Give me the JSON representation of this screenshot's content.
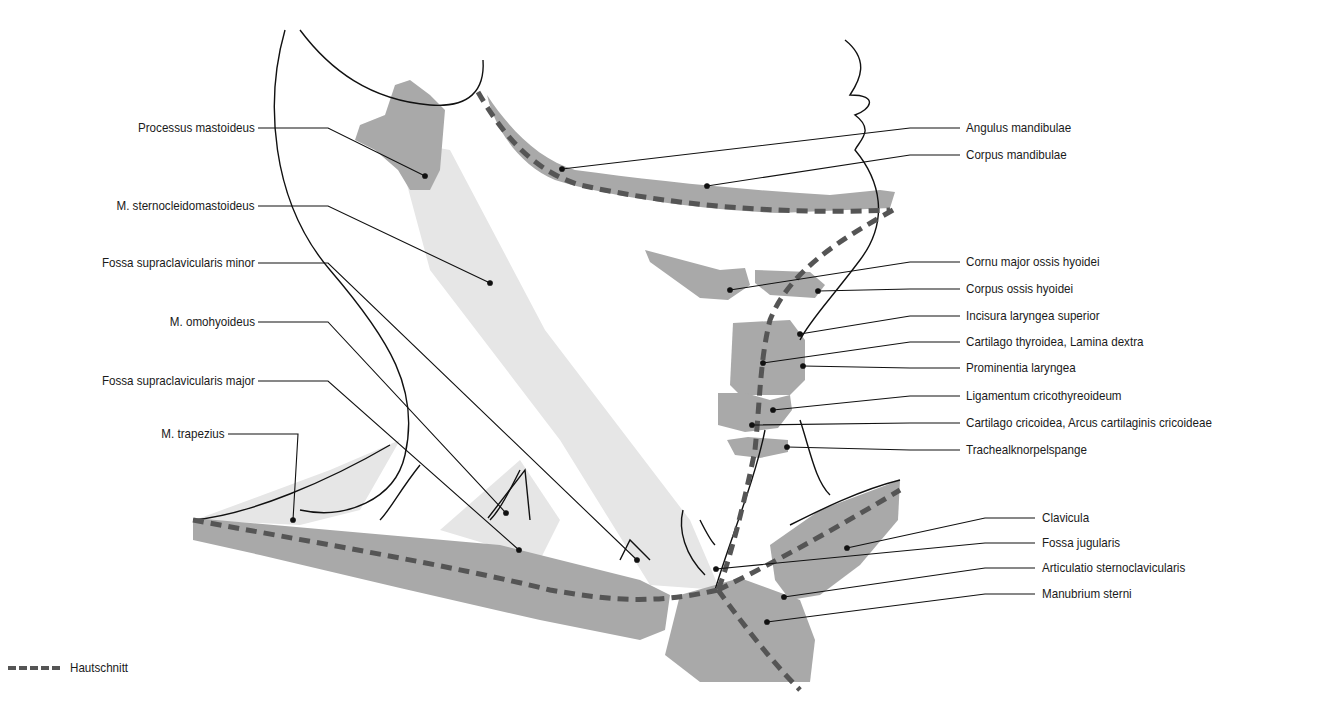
{
  "figure": {
    "colors": {
      "bone": "#a9a9a9",
      "muscle": "#e6e6e6",
      "outline": "#111111",
      "incision": "#555555",
      "background": "#ffffff"
    }
  },
  "labels_left": [
    {
      "text": "Processus mastoideus",
      "y": 128,
      "line_end_x": 425,
      "line_end_y": 176
    },
    {
      "text": "M. sternocleidomastoideus",
      "y": 206,
      "line_end_x": 490,
      "line_end_y": 283
    },
    {
      "text": "Fossa supraclavicularis minor",
      "y": 263,
      "line_end_x": 637,
      "line_end_y": 560
    },
    {
      "text": "M. omohyoideus",
      "y": 322,
      "line_end_x": 506,
      "line_end_y": 513
    },
    {
      "text": "Fossa supraclavicularis major",
      "y": 381,
      "line_end_x": 519,
      "line_end_y": 550
    },
    {
      "text": "M. trapezius",
      "y": 434,
      "line_end_x": 293,
      "line_end_y": 520
    }
  ],
  "labels_right": [
    {
      "text": "Angulus mandibulae",
      "y": 128,
      "line_end_x": 562,
      "line_end_y": 169
    },
    {
      "text": "Corpus mandibulae",
      "y": 155,
      "line_end_x": 707,
      "line_end_y": 186
    },
    {
      "text": "Cornu major ossis hyoidei",
      "y": 262,
      "line_end_x": 730,
      "line_end_y": 290
    },
    {
      "text": "Corpus ossis hyoidei",
      "y": 289,
      "line_end_x": 818,
      "line_end_y": 291
    },
    {
      "text": "Incisura laryngea superior",
      "y": 316,
      "line_end_x": 800,
      "line_end_y": 334
    },
    {
      "text": "Cartilago thyroidea, Lamina dextra",
      "y": 342,
      "line_end_x": 763,
      "line_end_y": 363
    },
    {
      "text": "Prominentia laryngea",
      "y": 368,
      "line_end_x": 803,
      "line_end_y": 366
    },
    {
      "text": "Ligamentum cricothyreoideum",
      "y": 396,
      "line_end_x": 773,
      "line_end_y": 410
    },
    {
      "text": "Cartilago cricoidea, Arcus cartilaginis cricoideae",
      "y": 423,
      "line_end_x": 752,
      "line_end_y": 425
    },
    {
      "text": "Trachealknorpelspange",
      "y": 450,
      "line_end_x": 787,
      "line_end_y": 447
    },
    {
      "text": "Clavicula",
      "y": 518,
      "line_end_x": 847,
      "line_end_y": 548
    },
    {
      "text": "Fossa jugularis",
      "y": 543,
      "line_end_x": 716,
      "line_end_y": 569
    },
    {
      "text": "Articulatio sternoclavicularis",
      "y": 568,
      "line_end_x": 784,
      "line_end_y": 597
    },
    {
      "text": "Manubrium sterni",
      "y": 594,
      "line_end_x": 767,
      "line_end_y": 622
    }
  ],
  "legend": {
    "items": [
      {
        "symbol": "dashed-line",
        "label": "Hautschnitt"
      }
    ]
  }
}
